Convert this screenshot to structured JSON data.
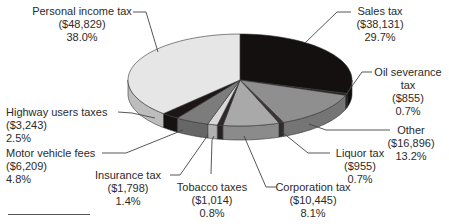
{
  "chart_data": {
    "type": "pie",
    "style": "3d-exploded-none",
    "title": "",
    "unit": "thousands of dollars (implied)",
    "slices": [
      {
        "label": "Sales tax",
        "value": 38131,
        "value_text": "($38,131)",
        "percent": 29.7,
        "percent_text": "29.7%",
        "color": "#141010"
      },
      {
        "label": "Oil severance tax",
        "value": 855,
        "value_text": "($855)",
        "percent": 0.7,
        "percent_text": "0.7%",
        "color": "#2a2424"
      },
      {
        "label": "Other",
        "value": 16896,
        "value_text": "($16,896)",
        "percent": 13.2,
        "percent_text": "13.2%",
        "color": "#8f8f8f"
      },
      {
        "label": "Liquor tax",
        "value": 955,
        "value_text": "($955)",
        "percent": 0.7,
        "percent_text": "0.7%",
        "color": "#3a3434"
      },
      {
        "label": "Corporation tax",
        "value": 10445,
        "value_text": "($10,445)",
        "percent": 8.1,
        "percent_text": "8.1%",
        "color": "#a9a9a9"
      },
      {
        "label": "Tobacco taxes",
        "value": 1014,
        "value_text": "($1,014)",
        "percent": 0.8,
        "percent_text": "0.8%",
        "color": "#2e2828"
      },
      {
        "label": "Insurance tax",
        "value": 1798,
        "value_text": "($1,798)",
        "percent": 1.4,
        "percent_text": "1.4%",
        "color": "#d8d8d8"
      },
      {
        "label": "Motor vehicle fees",
        "value": 6209,
        "value_text": "($6,209)",
        "percent": 4.8,
        "percent_text": "4.8%",
        "color": "#7c7c7c"
      },
      {
        "label": "Highway users taxes",
        "value": 3243,
        "value_text": "($3,243)",
        "percent": 2.5,
        "percent_text": "2.5%",
        "color": "#1c1616"
      },
      {
        "label": "Personal income tax",
        "value": 48829,
        "value_text": "($48,829)",
        "percent": 38.0,
        "percent_text": "38.0%",
        "color": "#e6e6e6"
      }
    ],
    "start_angle_deg": 0,
    "direction": "clockwise",
    "legend": "none (leader-line labels)"
  },
  "labels": {
    "personal": {
      "name": "Personal income tax",
      "value": "($48,829)",
      "pct": "38.0%"
    },
    "sales": {
      "name": "Sales tax",
      "value": "($38,131)",
      "pct": "29.7%"
    },
    "oil": {
      "name1": "Oil severance",
      "name2": "tax",
      "value": "($855)",
      "pct": "0.7%"
    },
    "other": {
      "name": "Other",
      "value": "($16,896)",
      "pct": "13.2%"
    },
    "liquor": {
      "name": "Liquor tax",
      "value": "($955)",
      "pct": "0.7%"
    },
    "corporation": {
      "name": "Corporation tax",
      "value": "($10,445)",
      "pct": "8.1%"
    },
    "tobacco": {
      "name": "Tobacco taxes",
      "value": "($1,014)",
      "pct": "0.8%"
    },
    "insurance": {
      "name": "Insurance tax",
      "value": "($1,798)",
      "pct": "1.4%"
    },
    "motor": {
      "name": "Motor vehicle fees",
      "value": "($6,209)",
      "pct": "4.8%"
    },
    "highway": {
      "name": "Highway users taxes",
      "value": "($3,243)",
      "pct": "2.5%"
    }
  }
}
